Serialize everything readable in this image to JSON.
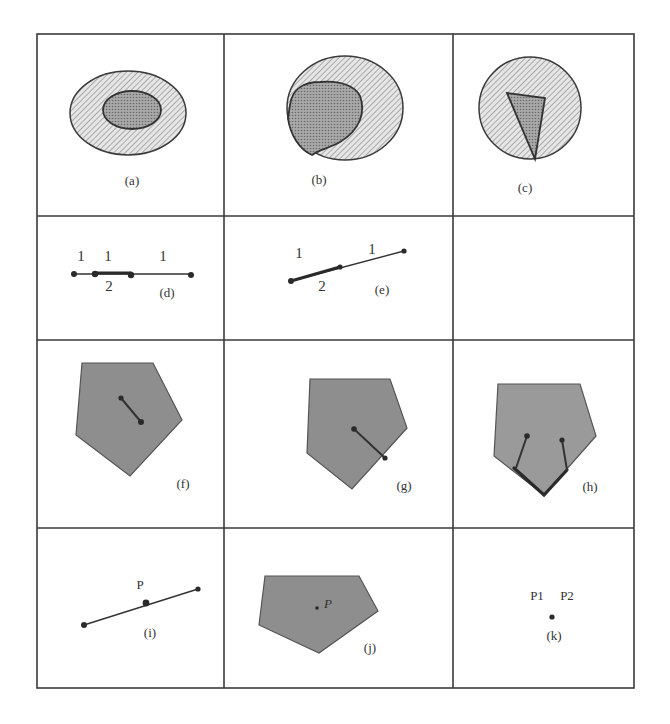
{
  "figure": {
    "grid": {
      "rows": 4,
      "cols": 3
    },
    "colors": {
      "border": "#3a3a3a",
      "hatched_region": "#d6d6d6",
      "dotted_region": "#8a8a8a",
      "polygon_fill": "#8e8e8e",
      "background": "#ffffff"
    },
    "panels": [
      {
        "id": "a",
        "label": "(a)",
        "description": "hatched ellipse containing a dotted ellipse"
      },
      {
        "id": "b",
        "label": "(b)",
        "description": "hatched circle overlapped by a dotted blob touching its boundary"
      },
      {
        "id": "c",
        "label": "(c)",
        "description": "hatched circle containing a dotted triangle touching boundary"
      },
      {
        "id": "d",
        "label": "(d)",
        "description": "collinear segments with overlap",
        "annotations": [
          "1",
          "1",
          "1",
          "2"
        ]
      },
      {
        "id": "e",
        "label": "(e)",
        "description": "slanted segment with thick overlapped part",
        "annotations": [
          "1",
          "1",
          "2"
        ]
      },
      {
        "id": "empty",
        "label": "",
        "description": "empty cell"
      },
      {
        "id": "f",
        "label": "(f)",
        "description": "pentagon with interior segment"
      },
      {
        "id": "g",
        "label": "(g)",
        "description": "pentagon with segment reaching boundary"
      },
      {
        "id": "h",
        "label": "(h)",
        "description": "pentagon with two segments reaching thick boundary"
      },
      {
        "id": "i",
        "label": "(i)",
        "description": "point P on a line segment",
        "annotations": [
          "P"
        ]
      },
      {
        "id": "j",
        "label": "(j)",
        "description": "point P inside a pentagon",
        "annotations": [
          "P"
        ]
      },
      {
        "id": "k",
        "label": "(k)",
        "description": "two coincident points",
        "annotations": [
          "P1",
          "P2"
        ]
      }
    ]
  }
}
